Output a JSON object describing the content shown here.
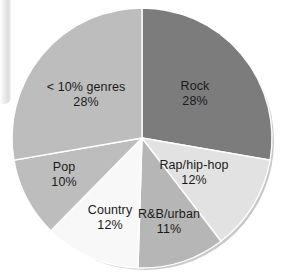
{
  "chart_data": {
    "type": "pie",
    "title": "",
    "subtitle": "",
    "xlabel": "",
    "ylabel": "",
    "legend_position": "none",
    "grid": false,
    "labels_inside_slices": true,
    "start_angle_deg": 0,
    "direction": "clockwise",
    "units": "percent",
    "categories": [
      "Rock",
      "Rap/hip-hop",
      "R&B/urban",
      "Country",
      "Pop",
      "< 10% genres"
    ],
    "values": [
      28,
      12,
      11,
      12,
      10,
      28
    ],
    "slices": [
      {
        "label": "Rock",
        "value": 28,
        "value_text": "28%",
        "color": "#7c7c7c"
      },
      {
        "label": "Rap/hip-hop",
        "value": 12,
        "value_text": "12%",
        "color": "#e2e2e2"
      },
      {
        "label": "R&B/urban",
        "value": 11,
        "value_text": "11%",
        "color": "#b6b6b6"
      },
      {
        "label": "Country",
        "value": 12,
        "value_text": "12%",
        "color": "#f8f8f8"
      },
      {
        "label": "Pop",
        "value": 10,
        "value_text": "10%",
        "color": "#bdbdbd"
      },
      {
        "label": "< 10% genres",
        "value": 28,
        "value_text": "28%",
        "color": "#bdbdbd"
      }
    ]
  },
  "colors": {
    "background": "#ffffff",
    "rock": "#7c7c7c",
    "rap_hip_hop": "#e2e2e2",
    "rnb_urban": "#b6b6b6",
    "country": "#f8f8f8",
    "pop": "#bdbdbd",
    "small_genres": "#bdbdbd",
    "slice_outline": "#ffffff",
    "label_text": "#1a1a1a",
    "rim_shadow": "#9a9a9a"
  }
}
